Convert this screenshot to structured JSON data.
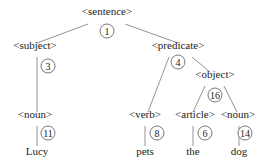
{
  "diagram": {
    "type": "parse-tree",
    "nodes": [
      {
        "id": "sentence",
        "label": "<sentence>",
        "num": "1",
        "x": 107,
        "y": 11,
        "nx": 107,
        "ny": 31
      },
      {
        "id": "subject",
        "label": "<subject>",
        "num": "3",
        "x": 35,
        "y": 45,
        "nx": 48,
        "ny": 66
      },
      {
        "id": "predicate",
        "label": "<predicate>",
        "num": "4",
        "x": 178,
        "y": 45,
        "nx": 178,
        "ny": 62
      },
      {
        "id": "object",
        "label": "<object>",
        "num": "16",
        "x": 215,
        "y": 74,
        "nx": 215,
        "ny": 95
      },
      {
        "id": "noun1",
        "label": "<noun>",
        "num": "11",
        "x": 35,
        "y": 114,
        "nx": 48,
        "ny": 133
      },
      {
        "id": "verb",
        "label": "<verb>",
        "num": "8",
        "x": 145,
        "y": 114,
        "nx": 157,
        "ny": 133
      },
      {
        "id": "article",
        "label": "<article>",
        "num": "6",
        "x": 195,
        "y": 114,
        "nx": 205,
        "ny": 133
      },
      {
        "id": "noun2",
        "label": "<noun>",
        "num": "14",
        "x": 238,
        "y": 114,
        "nx": 245,
        "ny": 133
      }
    ],
    "leaves": [
      {
        "id": "lucy",
        "label": "Lucy",
        "x": 37,
        "y": 151
      },
      {
        "id": "pets",
        "label": "pets",
        "x": 145,
        "y": 151
      },
      {
        "id": "the",
        "label": "the",
        "x": 193,
        "y": 151
      },
      {
        "id": "dog",
        "label": "dog",
        "x": 239,
        "y": 151
      }
    ]
  }
}
